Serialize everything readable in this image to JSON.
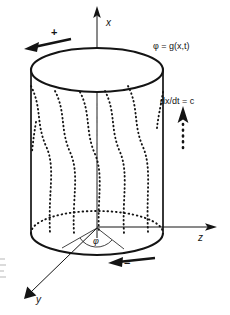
{
  "figure": {
    "background_color": "#ffffff",
    "ink_color": "#141414",
    "axes": [
      {
        "name": "x-axis",
        "label": "x",
        "direction": "up"
      },
      {
        "name": "z-axis",
        "label": "z",
        "direction": "right"
      },
      {
        "name": "y-axis",
        "label": "y",
        "direction": "down-left"
      }
    ],
    "annotations": {
      "field_equation": "φ = g(x,t)",
      "speed_equation": "dx/dt = c",
      "angle_symbol": "φ",
      "positive_sign": "+",
      "negative_sign": "−"
    },
    "arrows": [
      {
        "name": "top-rotation-arrow",
        "style": "solid",
        "direction": "left",
        "sign": "+"
      },
      {
        "name": "bottom-rotation-arrow",
        "style": "solid",
        "direction": "left",
        "sign": "−"
      },
      {
        "name": "speed-arrow",
        "style": "dotted",
        "direction": "up"
      }
    ],
    "cylinder": {
      "top_ellipse": "solid",
      "bottom_front_arc": "solid",
      "bottom_back_arc": "dotted",
      "surface_curves": "dotted wavy helices",
      "center_axis": "dash-dot"
    }
  }
}
